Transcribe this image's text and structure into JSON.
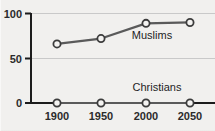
{
  "chart_data": {
    "type": "line",
    "title": "",
    "subtitle": "",
    "xlabel": "",
    "ylabel": "",
    "x": [
      1900,
      1950,
      2000,
      2050
    ],
    "xtick_labels": [
      "1900",
      "1950",
      "2000",
      "2050"
    ],
    "ytick_labels": [
      "0",
      "50",
      "100"
    ],
    "yticks": [
      0,
      50,
      100
    ],
    "ylim": [
      0,
      100
    ],
    "xlim": [
      1880,
      2070
    ],
    "grid": "horizontal",
    "legend_position": "inline-right",
    "series": [
      {
        "name": "Muslims",
        "label": "Muslims",
        "values": [
          66,
          72,
          89,
          90
        ],
        "color": "#5a5a5a",
        "marker": "open-circle"
      },
      {
        "name": "Christians",
        "label": "Christians",
        "values": [
          0,
          0,
          0,
          0
        ],
        "color": "#5a5a5a",
        "marker": "open-circle"
      }
    ],
    "annotations": [
      {
        "text": "Muslims",
        "x": 2010,
        "y": 72
      },
      {
        "text": "Christians",
        "x": 2010,
        "y": 19
      }
    ]
  },
  "colors": {
    "background": "#f1f0ee",
    "axis": "#1c1c1c",
    "grid": "#c9c9c9",
    "line": "#5a5a5a",
    "marker_fill": "#f4f3f1",
    "text": "#2b2b2b"
  },
  "clipped_header": {
    "text": ""
  }
}
